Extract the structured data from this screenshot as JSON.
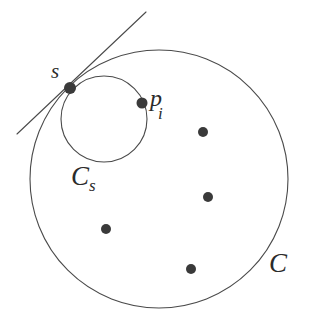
{
  "figure": {
    "background_color": "#ffffff",
    "stroke_color": "#4a4a4a",
    "point_color": "#3a3a3a",
    "label_color": "#2b2b2b",
    "width": 314,
    "height": 329
  },
  "labels": {
    "s": "s",
    "p": "p",
    "p_subscript": "i",
    "c_s_main": "C",
    "c_s_subscript": "s",
    "c": "C"
  },
  "chart_data": {
    "type": "scatter",
    "xlabel": "",
    "ylabel": "",
    "xlim": [
      0,
      314
    ],
    "ylim": [
      329,
      0
    ],
    "grid": false,
    "legend": "none",
    "shapes": [
      {
        "name": "circle-C",
        "kind": "circle",
        "label": "C",
        "label_position": [
          278,
          264
        ],
        "cx": 159,
        "cy": 179,
        "r": 129,
        "filled": false,
        "stroke": "#4a4a4a",
        "stroke_width": 1.1
      },
      {
        "name": "circle-Cs",
        "kind": "circle",
        "label": "C_s",
        "label_position": [
          84,
          180
        ],
        "cx": 104,
        "cy": 119,
        "r": 43,
        "filled": false,
        "stroke": "#4a4a4a",
        "stroke_width": 1.1
      },
      {
        "name": "tangent-line",
        "kind": "line",
        "x1": 146,
        "y1": 12,
        "x2": 17,
        "y2": 134,
        "stroke": "#4a4a4a",
        "stroke_width": 1.1
      }
    ],
    "points": [
      {
        "name": "point-s",
        "label": "s",
        "x": 70,
        "y": 88,
        "r": 6.0
      },
      {
        "name": "point-pi",
        "label": "p_i",
        "x": 142,
        "y": 103,
        "r": 5.5
      },
      {
        "name": "point-1",
        "label": "",
        "x": 203,
        "y": 132,
        "r": 5.0
      },
      {
        "name": "point-2",
        "label": "",
        "x": 208,
        "y": 197,
        "r": 5.0
      },
      {
        "name": "point-3",
        "label": "",
        "x": 106,
        "y": 229,
        "r": 5.0
      },
      {
        "name": "point-4",
        "label": "",
        "x": 191,
        "y": 269,
        "r": 5.0
      }
    ]
  }
}
